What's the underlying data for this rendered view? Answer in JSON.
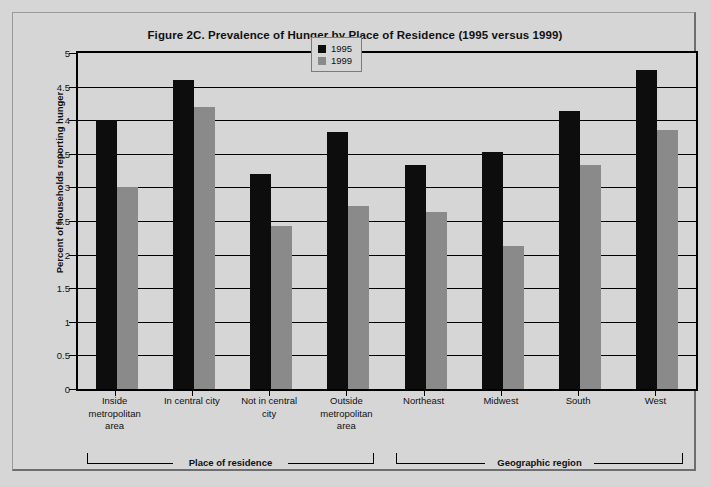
{
  "figure": {
    "background_color": "#d6d6d6",
    "frame_color": "#6e6e6e"
  },
  "chart_data": {
    "type": "bar",
    "title": "Figure 2C. Prevalence of Hunger by Place of Residence (1995 versus 1999)",
    "xlabel": "",
    "ylabel": "Percent of households reporting hunger",
    "ylim": [
      0,
      5
    ],
    "ytick_labels": [
      "0",
      "0.5",
      "1",
      "1.5",
      "2",
      "2.5",
      "3",
      "3.5",
      "4",
      "4.5",
      "5"
    ],
    "ytick_values": [
      0,
      0.5,
      1,
      1.5,
      2,
      2.5,
      3,
      3.5,
      4,
      4.5,
      5
    ],
    "grid": true,
    "legend_position": "top-center",
    "categories": [
      "Inside metropolitan area",
      "In central city",
      "Not in central city",
      "Outside metropolitan area",
      "Northeast",
      "Midwest",
      "South",
      "West"
    ],
    "category_label_lines": [
      [
        "Inside",
        "metropolitan",
        "area"
      ],
      [
        "In central city"
      ],
      [
        "Not in central",
        "city"
      ],
      [
        "Outside",
        "metropolitan",
        "area"
      ],
      [
        "Northeast"
      ],
      [
        "Midwest"
      ],
      [
        "South"
      ],
      [
        "West"
      ]
    ],
    "series": [
      {
        "name": "1995",
        "color": "#0d0d0d",
        "values": [
          4.0,
          4.6,
          3.2,
          3.82,
          3.33,
          3.52,
          4.13,
          4.75
        ]
      },
      {
        "name": "1999",
        "color": "#8a8a8a",
        "values": [
          3.0,
          4.2,
          2.42,
          2.72,
          2.63,
          2.13,
          3.33,
          3.85
        ]
      }
    ],
    "groups": [
      {
        "label": "Place of residence",
        "start_category": 0,
        "end_category": 3
      },
      {
        "label": "Geographic region",
        "start_category": 4,
        "end_category": 7
      }
    ]
  }
}
